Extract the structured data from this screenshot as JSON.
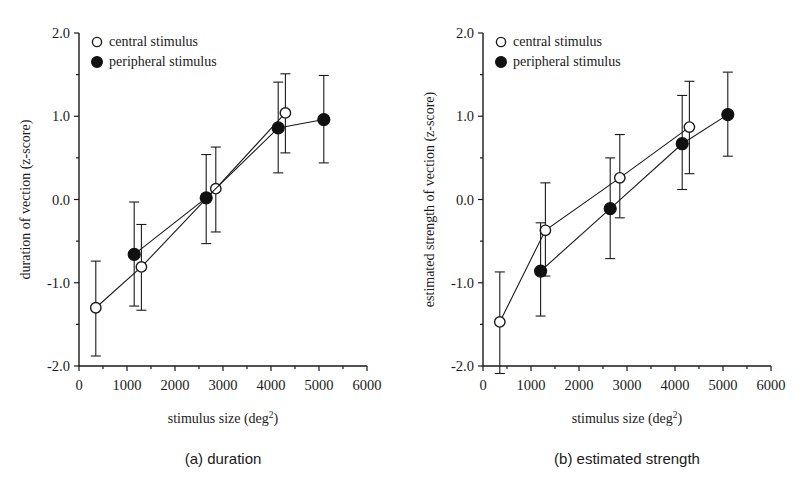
{
  "figure": {
    "background": "#ffffff",
    "ink_color": "#1a1a1a",
    "marker_open_fill": "#ffffff",
    "marker_closed_fill": "#111111"
  },
  "legend": {
    "position": "top-left",
    "entries": [
      {
        "key": "central",
        "label": "central stimulus",
        "marker": "open-circle"
      },
      {
        "key": "peripheral",
        "label": "peripheral stimulus",
        "marker": "filled-circle"
      }
    ]
  },
  "axis": {
    "x_ticks": [
      0,
      1000,
      2000,
      3000,
      4000,
      5000,
      6000
    ],
    "x_tick_labels": [
      "0",
      "1000",
      "2000",
      "3000",
      "4000",
      "5000",
      "6000"
    ],
    "y_ticks": [
      -2.0,
      -1.0,
      0.0,
      1.0,
      2.0
    ],
    "y_tick_labels": [
      "-2.0",
      "-1.0",
      "0.0",
      "1.0",
      "2.0"
    ],
    "y_minor_ticks": [
      -1.5,
      -0.5,
      0.5,
      1.5
    ],
    "x_minor_ticks": [
      500,
      1500,
      2500,
      3500,
      4500,
      5500
    ],
    "xlim": [
      0,
      6000
    ],
    "ylim": [
      -2.0,
      2.0
    ],
    "xlabel_main": "stimulus size (deg",
    "xlabel_sup": "2",
    "xlabel_tail": ")",
    "grid": false
  },
  "chart_data": [
    {
      "id": "panel-a",
      "type": "line",
      "caption": "(a)  duration",
      "caption_tag": "(a)",
      "caption_text": "duration",
      "title": "",
      "xlabel": "stimulus size (deg2)",
      "ylabel": "duration of vection (z-score)",
      "xlim": [
        0,
        6000
      ],
      "ylim": [
        -2.0,
        2.0
      ],
      "grid": false,
      "legend_position": "top-left",
      "series": [
        {
          "name": "central stimulus",
          "marker": "open-circle",
          "x": [
            350,
            1300,
            2850,
            4300
          ],
          "y": [
            -1.3,
            -0.81,
            0.13,
            1.04
          ],
          "yerr_upper": [
            0.56,
            0.51,
            0.5,
            0.47
          ],
          "yerr_lower": [
            0.58,
            0.52,
            0.52,
            0.48
          ]
        },
        {
          "name": "peripheral stimulus",
          "marker": "filled-circle",
          "x": [
            1150,
            2650,
            4150,
            5100
          ],
          "y": [
            -0.66,
            0.02,
            0.86,
            0.96
          ],
          "yerr_upper": [
            0.63,
            0.52,
            0.55,
            0.53
          ],
          "yerr_lower": [
            0.62,
            0.55,
            0.54,
            0.52
          ]
        }
      ]
    },
    {
      "id": "panel-b",
      "type": "line",
      "caption": "(b)  estimated strength",
      "caption_tag": "(b)",
      "caption_text": "estimated strength",
      "title": "",
      "xlabel": "stimulus size (deg2)",
      "ylabel": "estimated strength of vection (z-score)",
      "xlim": [
        0,
        6000
      ],
      "ylim": [
        -2.0,
        2.0
      ],
      "grid": false,
      "legend_position": "top-left",
      "series": [
        {
          "name": "central stimulus",
          "marker": "open-circle",
          "x": [
            350,
            1300,
            2850,
            4300
          ],
          "y": [
            -1.47,
            -0.37,
            0.26,
            0.87
          ],
          "yerr_upper": [
            0.6,
            0.57,
            0.52,
            0.55
          ],
          "yerr_lower": [
            0.62,
            0.55,
            0.48,
            0.56
          ]
        },
        {
          "name": "peripheral stimulus",
          "marker": "filled-circle",
          "x": [
            1200,
            2650,
            4150,
            5100
          ],
          "y": [
            -0.86,
            -0.11,
            0.67,
            1.02
          ],
          "yerr_upper": [
            0.58,
            0.61,
            0.58,
            0.51
          ],
          "yerr_lower": [
            0.54,
            0.6,
            0.55,
            0.5
          ]
        }
      ]
    }
  ]
}
